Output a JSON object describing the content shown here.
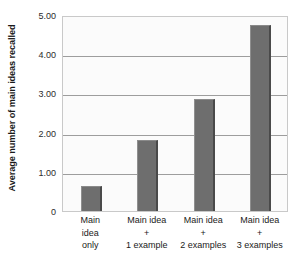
{
  "chart_data": {
    "type": "bar",
    "title": "",
    "xlabel": "",
    "ylabel": "Average number of main ideas recalled",
    "categories": [
      "Main idea only",
      "Main idea + 1 example",
      "Main idea + 2 examples",
      "Main idea + 3 examples"
    ],
    "category_lines": [
      [
        "Main",
        "idea",
        "only"
      ],
      [
        "Main idea",
        "+",
        "1 example"
      ],
      [
        "Main idea",
        "+",
        "2 examples"
      ],
      [
        "Main idea",
        "+",
        "3 examples"
      ]
    ],
    "values": [
      0.65,
      1.8,
      2.85,
      4.75
    ],
    "ylim": [
      0,
      5
    ],
    "yticks": [
      0,
      1,
      2,
      3,
      4,
      5
    ],
    "ytick_labels": [
      "0",
      "1.00",
      "2.00",
      "3.00",
      "4.00",
      "5.00"
    ],
    "grid": true,
    "legend": false,
    "bar_color": "#6e6e6e",
    "bar_edge_color": "#4a4a4a",
    "plot_background": "#fbfbfb",
    "grid_color": "#9d9d9d",
    "axis_border_color": "#c9c9c9"
  }
}
